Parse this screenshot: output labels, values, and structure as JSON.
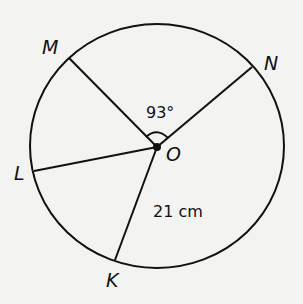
{
  "diagram": {
    "points": {
      "M": "M",
      "N": "N",
      "L": "L",
      "K": "K",
      "O": "O"
    },
    "angle_label": "93°",
    "radius_label": "21 cm",
    "colors": {
      "stroke": "#111111",
      "background": "#f3f3f1"
    }
  }
}
